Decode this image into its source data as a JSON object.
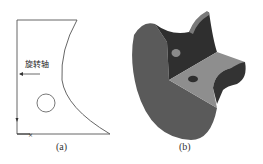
{
  "figure_a": {
    "caption": "(a)",
    "axis_label": "旋转轴",
    "stroke_color": "#555555"
  },
  "figure_b": {
    "caption": "(b)",
    "colors": {
      "outer_face": "#5a5a5a",
      "dark_face": "#2e2e2e",
      "light_face": "#8c8c8c",
      "hole": "#3a3a3a"
    }
  }
}
